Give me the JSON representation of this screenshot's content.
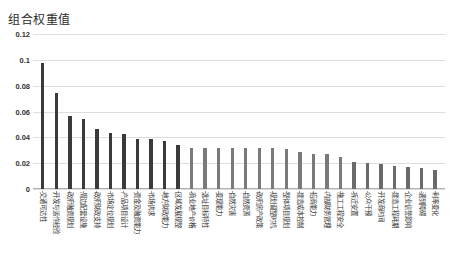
{
  "chart_data": {
    "type": "bar",
    "title": "组合权重值",
    "xlabel": "",
    "ylabel": "",
    "ylim": [
      0,
      0.12
    ],
    "yticks": [
      "0",
      "0.02",
      "0.04",
      "0.06",
      "0.08",
      "0.1",
      "0.12"
    ],
    "ytick_values": [
      0,
      0.02,
      0.04,
      0.06,
      0.08,
      0.1,
      0.12
    ],
    "grid": true,
    "legend": "none",
    "categories": [
      "交通可达性",
      "开发与运作经验",
      "政府融资规划",
      "周边配套设施",
      "政府财政支持",
      "市场定位规划",
      "产品项目设计",
      "资金及融资能力",
      "市场供求",
      "地方财政能力",
      "区域发展规整",
      "商业地产价格",
      "选址目标特性",
      "变现能力",
      "自然灾害",
      "自然资源",
      "政府房产政策",
      "规划调整时机",
      "整体项目规划",
      "建造成本控制",
      "招商能力",
      "内部财务管理",
      "施工工程安全",
      "拆迁安置",
      "公众干预",
      "开发商时间",
      "建造工程耗期",
      "企业信誉影响",
      "遇到障碍",
      "利率变化"
    ],
    "values": [
      0.0975,
      0.074,
      0.0565,
      0.0545,
      0.0465,
      0.043,
      0.0425,
      0.039,
      0.0385,
      0.037,
      0.034,
      0.032,
      0.032,
      0.0318,
      0.0318,
      0.0317,
      0.0315,
      0.0315,
      0.0313,
      0.0285,
      0.027,
      0.0268,
      0.0245,
      0.0208,
      0.0205,
      0.019,
      0.0178,
      0.0172,
      0.016,
      0.0145
    ],
    "bar_colors": [
      "#3a3a3a",
      "#3a3a3a",
      "#3a3a3a",
      "#3a3a3a",
      "#3a3a3a",
      "#3a3a3a",
      "#3a3a3a",
      "#3a3a3a",
      "#3a3a3a",
      "#3a3a3a",
      "#3a3a3a",
      "#7a7a7a",
      "#7a7a7a",
      "#7a7a7a",
      "#7a7a7a",
      "#7a7a7a",
      "#7a7a7a",
      "#7a7a7a",
      "#7a7a7a",
      "#7a7a7a",
      "#7a7a7a",
      "#7a7a7a",
      "#7a7a7a",
      "#6a6a6a",
      "#6a6a6a",
      "#6a6a6a",
      "#6a6a6a",
      "#6a6a6a",
      "#6a6a6a",
      "#6a6a6a"
    ],
    "colors": {
      "bar_dark": "#3a3a3a",
      "bar_light": "#7a7a7a",
      "gridline": "#dedede",
      "axis": "#b0b0b0",
      "text": "#2e2e2e",
      "background": "#ffffff"
    }
  },
  "caption": {
    "text": ""
  }
}
